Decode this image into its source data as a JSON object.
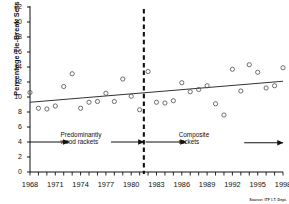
{
  "chart_data": {
    "type": "scatter",
    "title": "",
    "subtitle": "",
    "xlabel": "",
    "ylabel": "Percentage Tie-Break Sets",
    "xlim": [
      1968,
      1998
    ],
    "ylim": [
      0,
      22
    ],
    "ytick_values": [
      0,
      2,
      4,
      6,
      8,
      10,
      12,
      14,
      16,
      18,
      20,
      22
    ],
    "ytick_labels": [
      "0",
      "2",
      "4",
      "6",
      "8",
      "10",
      "12",
      "14",
      "16",
      "18",
      "20",
      "22"
    ],
    "xtick_values": [
      1968,
      1971,
      1974,
      1977,
      1980,
      1983,
      1986,
      1989,
      1992,
      1995,
      1998
    ],
    "xtick_labels": [
      "1968",
      "1971",
      "1974",
      "1977",
      "1980",
      "1983",
      "1986",
      "1989",
      "1992",
      "1995",
      "1998"
    ],
    "minor_xticks_every": 1,
    "grid": false,
    "legend": "none",
    "marker": "open-circle",
    "series": [
      {
        "name": "Percentage Tie-Break Sets",
        "x": [
          1968,
          1969,
          1970,
          1971,
          1972,
          1973,
          1974,
          1975,
          1976,
          1977,
          1978,
          1979,
          1980,
          1981,
          1982,
          1983,
          1984,
          1985,
          1986,
          1987,
          1988,
          1989,
          1990,
          1991,
          1992,
          1993,
          1994,
          1995,
          1996,
          1997,
          1998
        ],
        "y": [
          10.6,
          8.5,
          8.4,
          8.8,
          11.4,
          13.1,
          8.5,
          9.3,
          9.4,
          10.5,
          9.4,
          12.4,
          10.1,
          8.3,
          13.4,
          9.3,
          9.2,
          9.5,
          11.9,
          10.7,
          11.0,
          11.5,
          9.1,
          7.6,
          13.7,
          10.8,
          14.3,
          13.3,
          11.2,
          11.5,
          13.9
        ]
      }
    ],
    "trendline": {
      "name": "linear-trend",
      "x_start": 1968,
      "y_start": 9.3,
      "x_end": 1998,
      "y_end": 12.1
    },
    "reference_line": {
      "name": "racket-era-divider",
      "style": "dashed-vertical",
      "x": 1981.5
    },
    "annotations": [
      {
        "id": "wood-rackets",
        "text_line1": "Predominantly",
        "text_line2": "wood rackets",
        "x": 1974.0,
        "y": 4.0
      },
      {
        "id": "composite-rackets",
        "text_line1": "Composite",
        "text_line2": "rackets",
        "x": 1988.0,
        "y": 4.0
      }
    ],
    "era_arrows": [
      {
        "id": "arrow-wood-left",
        "x_from": 1968.0,
        "x_to": 1972.6,
        "y": 4.0
      },
      {
        "id": "arrow-wood-right",
        "x_from": 1977.6,
        "x_to": 1981.5,
        "y": 4.0
      },
      {
        "id": "arrow-composite-left",
        "x_from": 1981.7,
        "x_to": 1986.5,
        "y": 4.0
      },
      {
        "id": "arrow-composite-right",
        "x_from": 1993.4,
        "x_to": 1998.0,
        "y": 3.9
      }
    ],
    "source": "Source: ITF I.T. Dept.",
    "colors": {
      "axis": "#111111",
      "marker_stroke": "#555555",
      "trendline": "#333333",
      "reference_line": "#111111",
      "background": "#ffffff"
    }
  }
}
